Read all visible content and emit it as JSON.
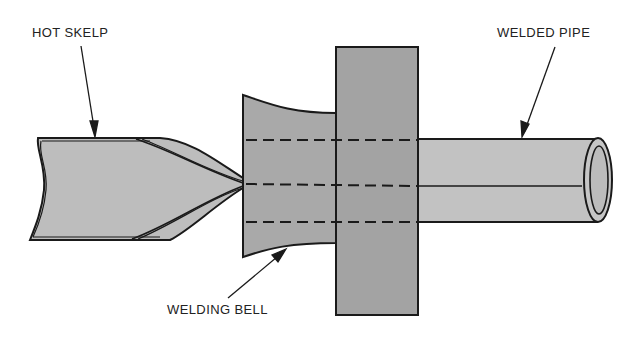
{
  "diagram": {
    "labels": {
      "hot_skelp": "HOT SKELP",
      "welded_pipe": "WELDED PIPE",
      "welding_bell": "WELDING BELL"
    },
    "colors": {
      "skelp_fill": "#bdbdbd",
      "bell_fill": "#a9a9a9",
      "die_fill": "#a3a3a3",
      "pipe_fill": "#c2c2c2",
      "outline": "#1a1a1a",
      "background": "#ffffff"
    },
    "components": [
      "hot skelp",
      "welding bell",
      "die block",
      "welded pipe"
    ]
  }
}
